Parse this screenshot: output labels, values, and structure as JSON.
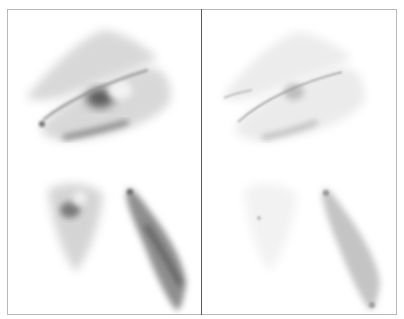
{
  "figure": {
    "panels": [
      {
        "id": "left",
        "description": "micrograph panel, inverted grayscale, higher intensity staining",
        "cells": [
          "upper-overlapping-cell-pair",
          "lower-left-triangular-cell",
          "lower-right-elongated-cell"
        ]
      },
      {
        "id": "right",
        "description": "micrograph panel, inverted grayscale, lower intensity staining",
        "cells": [
          "upper-overlapping-cell-pair",
          "lower-left-triangular-cell",
          "lower-right-elongated-cell"
        ]
      }
    ],
    "colors": {
      "background": "#ffffff",
      "frame": "#b8b8b8",
      "divider": "#5a5a5a",
      "stain_dark": "#3a3a3a"
    }
  }
}
